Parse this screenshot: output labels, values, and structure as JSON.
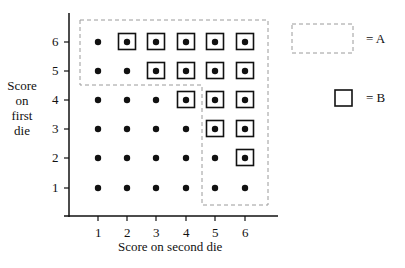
{
  "axes": {
    "x_label": "Score on second die",
    "y_label_lines": [
      "Score",
      "on",
      "first",
      "die"
    ],
    "x_ticks": [
      "1",
      "2",
      "3",
      "4",
      "5",
      "6"
    ],
    "y_ticks": [
      "1",
      "2",
      "3",
      "4",
      "5",
      "6"
    ]
  },
  "legend": {
    "a_label": "= A",
    "b_label": "= B"
  },
  "outcomes": {
    "description": "All 36 outcomes of two dice shown as dots; squared dots belong to event B (sum ≥ 8); dashed region is event A (first die ≥ 5 or second die ≥ 5).",
    "event_B": [
      [
        6,
        2
      ],
      [
        6,
        3
      ],
      [
        6,
        4
      ],
      [
        6,
        5
      ],
      [
        6,
        6
      ],
      [
        5,
        3
      ],
      [
        5,
        4
      ],
      [
        5,
        5
      ],
      [
        5,
        6
      ],
      [
        4,
        4
      ],
      [
        4,
        5
      ],
      [
        4,
        6
      ],
      [
        3,
        5
      ],
      [
        3,
        6
      ],
      [
        2,
        6
      ]
    ],
    "event_A_region": "first die in {5,6} OR second die in {5,6}"
  },
  "colors": {
    "ink": "#111111",
    "dashed": "#9a9a9a"
  }
}
